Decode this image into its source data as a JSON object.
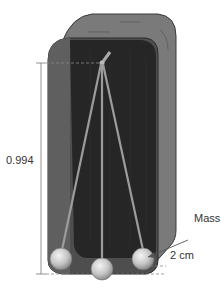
{
  "diagram": {
    "type": "pendulum-in-box",
    "labels": {
      "length": "0.994",
      "mass": "Mass",
      "offset": "2 cm"
    },
    "colors": {
      "box_outer": "#6e6e6e",
      "box_inner": "#2c2c2c",
      "box_side": "#4a4a4a",
      "rod": "#9a9a9a",
      "bob": "#d0d0d0",
      "line": "#555555"
    }
  }
}
